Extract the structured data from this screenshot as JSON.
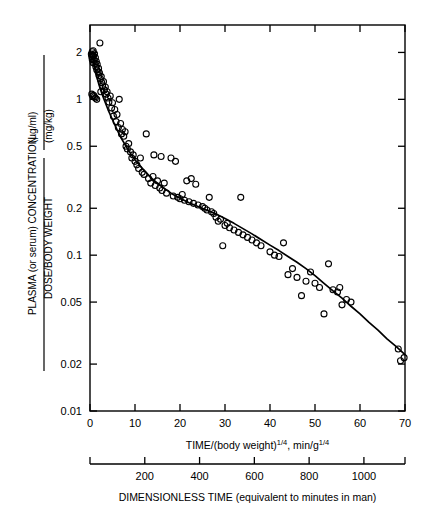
{
  "figure": {
    "background": "#ffffff",
    "ink": "#000000",
    "marker": "open-circle",
    "curve_color": "#000000"
  },
  "y_axis": {
    "title_numerator": "PLASMA (or serum) CONCENTRATION",
    "title_numerator_units": "(µg/ml)",
    "title_denominator": "DOSE/BODY WEIGHT",
    "title_denominator_units": "(mg/kg)",
    "scale": "log",
    "ticks": [
      0.01,
      0.02,
      0.05,
      0.1,
      0.2,
      0.5,
      1,
      2
    ],
    "tick_labels": [
      "0.01",
      "0.02",
      "0.05",
      "0.1",
      "0.2",
      "0.5",
      "1",
      "2"
    ],
    "limits": [
      0.01,
      3.0
    ]
  },
  "x_axis_primary": {
    "title": "TIME/(body weight)",
    "title_sup1": "1/4",
    "title_mid": ", min/g",
    "title_sup2": "1/4",
    "title_full": "TIME/(body weight)^1/4, min/g^1/4",
    "scale": "linear",
    "ticks": [
      0,
      10,
      20,
      30,
      40,
      50,
      60,
      70
    ],
    "tick_labels": [
      "0",
      "10",
      "20",
      "30",
      "40",
      "50",
      "60",
      "70"
    ],
    "limits": [
      0,
      70
    ]
  },
  "x_axis_secondary": {
    "title": "DIMENSIONLESS TIME (equivalent to minutes in man)",
    "ticks": [
      200,
      400,
      600,
      800,
      1000
    ],
    "tick_labels": [
      "200",
      "400",
      "600",
      "800",
      "1000"
    ],
    "limits": [
      0,
      1150
    ]
  },
  "chart_data": {
    "type": "scatter",
    "title": "",
    "xlabel": "TIME/(body weight)^1/4, min/g^1/4",
    "ylabel": "PLASMA (or serum) CONCENTRATION (µg/ml) / DOSE/BODY WEIGHT (mg/kg)",
    "xscale": "linear",
    "yscale": "log",
    "xlim": [
      0,
      70
    ],
    "ylim": [
      0.01,
      3.0
    ],
    "grid": false,
    "legend": false,
    "secondary_xlabel": "DIMENSIONLESS TIME (equivalent to minutes in man)",
    "secondary_xlim": [
      0,
      1150
    ],
    "marker_style": "open circle",
    "points": [
      [
        0.3,
        1.95
      ],
      [
        0.4,
        1.88
      ],
      [
        0.5,
        2.02
      ],
      [
        0.5,
        1.8
      ],
      [
        0.6,
        1.92
      ],
      [
        0.7,
        2.05
      ],
      [
        0.7,
        1.72
      ],
      [
        0.8,
        1.9
      ],
      [
        0.9,
        1.78
      ],
      [
        1.0,
        1.96
      ],
      [
        1.1,
        1.7
      ],
      [
        1.2,
        1.85
      ],
      [
        1.3,
        1.62
      ],
      [
        1.4,
        1.75
      ],
      [
        1.5,
        1.55
      ],
      [
        1.6,
        1.68
      ],
      [
        1.8,
        1.5
      ],
      [
        1.9,
        1.58
      ],
      [
        2.0,
        1.42
      ],
      [
        2.1,
        1.48
      ],
      [
        2.3,
        1.35
      ],
      [
        2.5,
        1.4
      ],
      [
        2.6,
        1.28
      ],
      [
        2.8,
        1.22
      ],
      [
        3.0,
        1.3
      ],
      [
        3.2,
        1.15
      ],
      [
        3.4,
        1.2
      ],
      [
        3.6,
        1.08
      ],
      [
        3.8,
        1.12
      ],
      [
        4.0,
        1.02
      ],
      [
        0.4,
        1.08
      ],
      [
        0.6,
        1.05
      ],
      [
        0.8,
        1.06
      ],
      [
        1.0,
        1.04
      ],
      [
        1.2,
        1.02
      ],
      [
        1.5,
        1.0
      ],
      [
        2.2,
        2.3
      ],
      [
        2.4,
        1.12
      ],
      [
        4.2,
        0.96
      ],
      [
        4.5,
        1.05
      ],
      [
        4.8,
        0.88
      ],
      [
        5.0,
        0.95
      ],
      [
        5.2,
        0.78
      ],
      [
        5.5,
        0.86
      ],
      [
        5.8,
        0.72
      ],
      [
        6.0,
        0.8
      ],
      [
        6.3,
        0.66
      ],
      [
        6.5,
        1.0
      ],
      [
        6.8,
        0.7
      ],
      [
        7.0,
        0.6
      ],
      [
        7.2,
        0.64
      ],
      [
        7.5,
        0.58
      ],
      [
        7.8,
        0.62
      ],
      [
        8.0,
        0.5
      ],
      [
        8.3,
        0.48
      ],
      [
        8.6,
        0.52
      ],
      [
        9.0,
        0.46
      ],
      [
        9.3,
        0.42
      ],
      [
        9.6,
        0.44
      ],
      [
        10.0,
        0.4
      ],
      [
        10.4,
        0.38
      ],
      [
        10.8,
        0.36
      ],
      [
        11.2,
        0.42
      ],
      [
        11.6,
        0.34
      ],
      [
        12.0,
        0.33
      ],
      [
        12.5,
        0.6
      ],
      [
        13.0,
        0.31
      ],
      [
        13.5,
        0.29
      ],
      [
        14.0,
        0.32
      ],
      [
        14.5,
        0.28
      ],
      [
        15.0,
        0.3
      ],
      [
        15.5,
        0.27
      ],
      [
        16.0,
        0.26
      ],
      [
        16.5,
        0.29
      ],
      [
        17.0,
        0.25
      ],
      [
        14.2,
        0.44
      ],
      [
        15.8,
        0.43
      ],
      [
        18.0,
        0.42
      ],
      [
        19.0,
        0.4
      ],
      [
        18.5,
        0.24
      ],
      [
        19.5,
        0.235
      ],
      [
        20.0,
        0.23
      ],
      [
        20.5,
        0.245
      ],
      [
        21.0,
        0.225
      ],
      [
        22.0,
        0.22
      ],
      [
        23.0,
        0.215
      ],
      [
        24.0,
        0.21
      ],
      [
        21.5,
        0.3
      ],
      [
        22.5,
        0.31
      ],
      [
        23.5,
        0.285
      ],
      [
        25.0,
        0.205
      ],
      [
        25.5,
        0.2
      ],
      [
        26.0,
        0.195
      ],
      [
        27.0,
        0.19
      ],
      [
        27.5,
        0.185
      ],
      [
        26.5,
        0.235
      ],
      [
        28.0,
        0.175
      ],
      [
        28.5,
        0.165
      ],
      [
        29.0,
        0.17
      ],
      [
        30.0,
        0.155
      ],
      [
        30.5,
        0.16
      ],
      [
        31.0,
        0.15
      ],
      [
        32.0,
        0.145
      ],
      [
        33.0,
        0.14
      ],
      [
        34.0,
        0.135
      ],
      [
        35.0,
        0.13
      ],
      [
        36.0,
        0.125
      ],
      [
        29.5,
        0.115
      ],
      [
        33.5,
        0.235
      ],
      [
        37.0,
        0.12
      ],
      [
        38.0,
        0.115
      ],
      [
        40.0,
        0.105
      ],
      [
        41.0,
        0.1
      ],
      [
        42.0,
        0.098
      ],
      [
        43.0,
        0.12
      ],
      [
        44.0,
        0.075
      ],
      [
        45.0,
        0.082
      ],
      [
        46.0,
        0.072
      ],
      [
        47.0,
        0.055
      ],
      [
        48.0,
        0.068
      ],
      [
        49.0,
        0.078
      ],
      [
        50.0,
        0.066
      ],
      [
        51.0,
        0.062
      ],
      [
        52.0,
        0.042
      ],
      [
        53.0,
        0.088
      ],
      [
        54.0,
        0.06
      ],
      [
        55.0,
        0.058
      ],
      [
        55.5,
        0.062
      ],
      [
        56.0,
        0.048
      ],
      [
        57.0,
        0.052
      ],
      [
        58.0,
        0.05
      ],
      [
        68.5,
        0.025
      ],
      [
        69.0,
        0.021
      ],
      [
        69.8,
        0.022
      ]
    ],
    "fit_curve": [
      [
        0.5,
        1.9
      ],
      [
        1.0,
        1.62
      ],
      [
        1.5,
        1.4
      ],
      [
        2.0,
        1.24
      ],
      [
        2.5,
        1.12
      ],
      [
        3.0,
        1.02
      ],
      [
        4.0,
        0.86
      ],
      [
        5.0,
        0.74
      ],
      [
        6.0,
        0.64
      ],
      [
        7.0,
        0.56
      ],
      [
        8.0,
        0.5
      ],
      [
        9.0,
        0.45
      ],
      [
        10.0,
        0.41
      ],
      [
        12.0,
        0.35
      ],
      [
        14.0,
        0.305
      ],
      [
        16.0,
        0.275
      ],
      [
        18.0,
        0.25
      ],
      [
        20.0,
        0.232
      ],
      [
        22.0,
        0.217
      ],
      [
        24.0,
        0.205
      ],
      [
        26.0,
        0.194
      ],
      [
        28.0,
        0.184
      ],
      [
        30.0,
        0.172
      ],
      [
        32.0,
        0.16
      ],
      [
        34.0,
        0.148
      ],
      [
        36.0,
        0.137
      ],
      [
        38.0,
        0.126
      ],
      [
        40.0,
        0.116
      ],
      [
        42.0,
        0.107
      ],
      [
        44.0,
        0.098
      ],
      [
        46.0,
        0.09
      ],
      [
        48.0,
        0.082
      ],
      [
        50.0,
        0.074
      ],
      [
        52.0,
        0.066
      ],
      [
        54.0,
        0.059
      ],
      [
        56.0,
        0.053
      ],
      [
        58.0,
        0.047
      ],
      [
        60.0,
        0.042
      ],
      [
        62.0,
        0.037
      ],
      [
        64.0,
        0.033
      ],
      [
        66.0,
        0.029
      ],
      [
        68.0,
        0.026
      ],
      [
        70.0,
        0.023
      ]
    ]
  }
}
